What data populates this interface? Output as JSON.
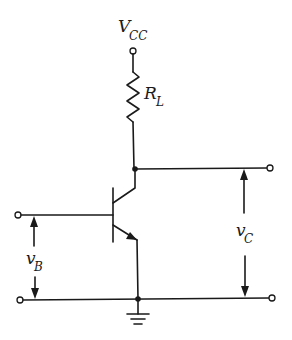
{
  "diagram": {
    "type": "common-emitter NPN transistor amplifier",
    "labels": {
      "supply": {
        "main": "V",
        "sub": "CC"
      },
      "load_resistor": {
        "main": "R",
        "sub": "L"
      },
      "input_voltage": {
        "main": "v",
        "sub": "B"
      },
      "output_voltage": {
        "main": "v",
        "sub": "C"
      }
    },
    "components": [
      {
        "id": "vcc-terminal",
        "kind": "terminal"
      },
      {
        "id": "load-resistor",
        "kind": "resistor",
        "label": "R_L"
      },
      {
        "id": "transistor",
        "kind": "npn-bjt"
      },
      {
        "id": "ground",
        "kind": "ground"
      },
      {
        "id": "input-terminals",
        "kind": "terminal-pair",
        "label": "v_B"
      },
      {
        "id": "output-terminals",
        "kind": "terminal-pair",
        "label": "v_C"
      }
    ],
    "colors": {
      "ink": "#1a1a1a",
      "background": "#ffffff"
    }
  }
}
